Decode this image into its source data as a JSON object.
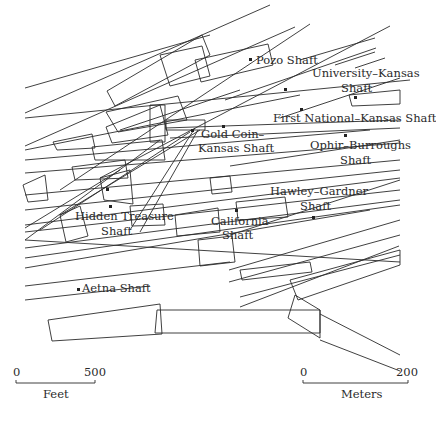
{
  "map": {
    "title": "Mine shafts and veins map",
    "line_color": "#2b2b2b",
    "background": "#ffffff"
  },
  "shafts": [
    {
      "id": "pozo",
      "label": "Pozo Shaft",
      "x": 251,
      "y": 60
    },
    {
      "id": "university-kansas",
      "label_line1": "University–Kansas",
      "label_line2": "Shaft",
      "x": 285,
      "y": 89
    },
    {
      "id": "first-national-kansas",
      "label": "First National–Kansas Shaft",
      "x": 301,
      "y": 108
    },
    {
      "id": "gold-coin-kansas",
      "label_line1": "Gold Coin–",
      "label_line2": "Kansas Shaft",
      "x": 192,
      "y": 131
    },
    {
      "id": "ophir-burroughs",
      "label_line1": "Ophir–Burroughs",
      "label_line2": "Shaft",
      "x": 345,
      "y": 136
    },
    {
      "id": "hawley-gardner",
      "label_line1": "Hawley–Gardner",
      "label_line2": "Shaft",
      "x": 314,
      "y": 217
    },
    {
      "id": "hidden-treasure",
      "label_line1": "Hidden Treasure",
      "label_line2": "Shaft",
      "x": 110,
      "y": 206
    },
    {
      "id": "california",
      "label_line1": "California",
      "label_line2": "Shaft",
      "x": 236,
      "y": 210
    },
    {
      "id": "aetna",
      "label": "Aetna Shaft",
      "x": 78,
      "y": 288
    }
  ],
  "scale_bars": {
    "feet": {
      "start": "0",
      "end": "500",
      "unit": "Feet"
    },
    "meters": {
      "start": "0",
      "end": "200",
      "unit": "Meters"
    }
  }
}
